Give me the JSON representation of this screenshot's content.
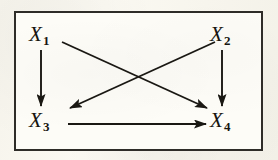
{
  "figure": {
    "kind": "directed-acyclic-graph",
    "background_color": "#f4f2ea",
    "panel_color": "#fdfcf7",
    "ink_color": "#17150f",
    "frame_color": "#2e2c28"
  },
  "nodes": [
    {
      "id": "x1",
      "var": "X",
      "subscript": "1",
      "label": "X1",
      "x": 38,
      "y": 34
    },
    {
      "id": "x2",
      "var": "X",
      "subscript": "2",
      "label": "X2",
      "x": 219,
      "y": 34
    },
    {
      "id": "x3",
      "var": "X",
      "subscript": "3",
      "label": "X3",
      "x": 38,
      "y": 120
    },
    {
      "id": "x4",
      "var": "X",
      "subscript": "4",
      "label": "X4",
      "x": 219,
      "y": 120
    }
  ],
  "edges": [
    {
      "id": "x1-x3",
      "from": "x1",
      "to": "x3",
      "style": "vertical",
      "arrow": "filled-triangle"
    },
    {
      "id": "x1-x4",
      "from": "x1",
      "to": "x4",
      "style": "diagonal",
      "arrow": "filled-triangle"
    },
    {
      "id": "x2-x3",
      "from": "x2",
      "to": "x3",
      "style": "diagonal",
      "arrow": "filled-triangle"
    },
    {
      "id": "x2-x4",
      "from": "x2",
      "to": "x4",
      "style": "vertical",
      "arrow": "filled-triangle"
    },
    {
      "id": "x3-x4",
      "from": "x3",
      "to": "x4",
      "style": "horizontal",
      "arrow": "filled-triangle"
    }
  ]
}
